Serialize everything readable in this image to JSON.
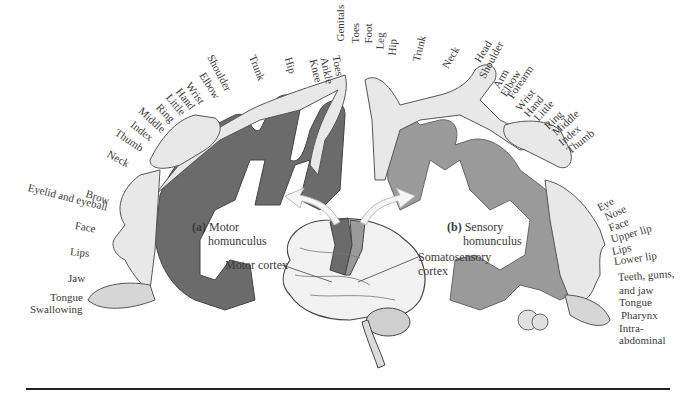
{
  "motor": {
    "caption_letter": "(a)",
    "caption_line1": "Motor",
    "caption_line2": "homunculus",
    "labels": [
      "Toes",
      "Ankle",
      "Knee",
      "Hip",
      "Trunk",
      "Shoulder",
      "Elbow",
      "Wrist",
      "Hand",
      "Little",
      "Ring",
      "Middle",
      "Index",
      "Thumb",
      "Neck",
      "Brow",
      "Eyelid and eyeball",
      "Face",
      "Lips",
      "Jaw",
      "Tongue",
      "Swallowing"
    ]
  },
  "sensory": {
    "caption_letter": "(b)",
    "caption_line1": "Sensory",
    "caption_line2": "homunculus",
    "labels": [
      "Genitals",
      "Toes",
      "Foot",
      "Leg",
      "Hip",
      "Trunk",
      "Neck",
      "Head",
      "Shoulder",
      "Arm",
      "Elbow",
      "Forearm",
      "Wrist",
      "Hand",
      "Little",
      "Ring",
      "Middle",
      "Index",
      "Thumb",
      "Eye",
      "Nose",
      "Face",
      "Upper lip",
      "Lips",
      "Lower lip",
      "Teeth, gums,",
      "and jaw",
      "Tongue",
      "Pharynx",
      "Intra-",
      "abdominal"
    ]
  },
  "brain": {
    "motor_cortex_label": "Motor cortex",
    "somatosensory_label_line1": "Somatosensory",
    "somatosensory_label_line2": "cortex"
  },
  "colors": {
    "motor_cortex": "#6b6b6b",
    "sensory_cortex": "#9a9a9a",
    "body_fill": "#e8e8e8"
  }
}
